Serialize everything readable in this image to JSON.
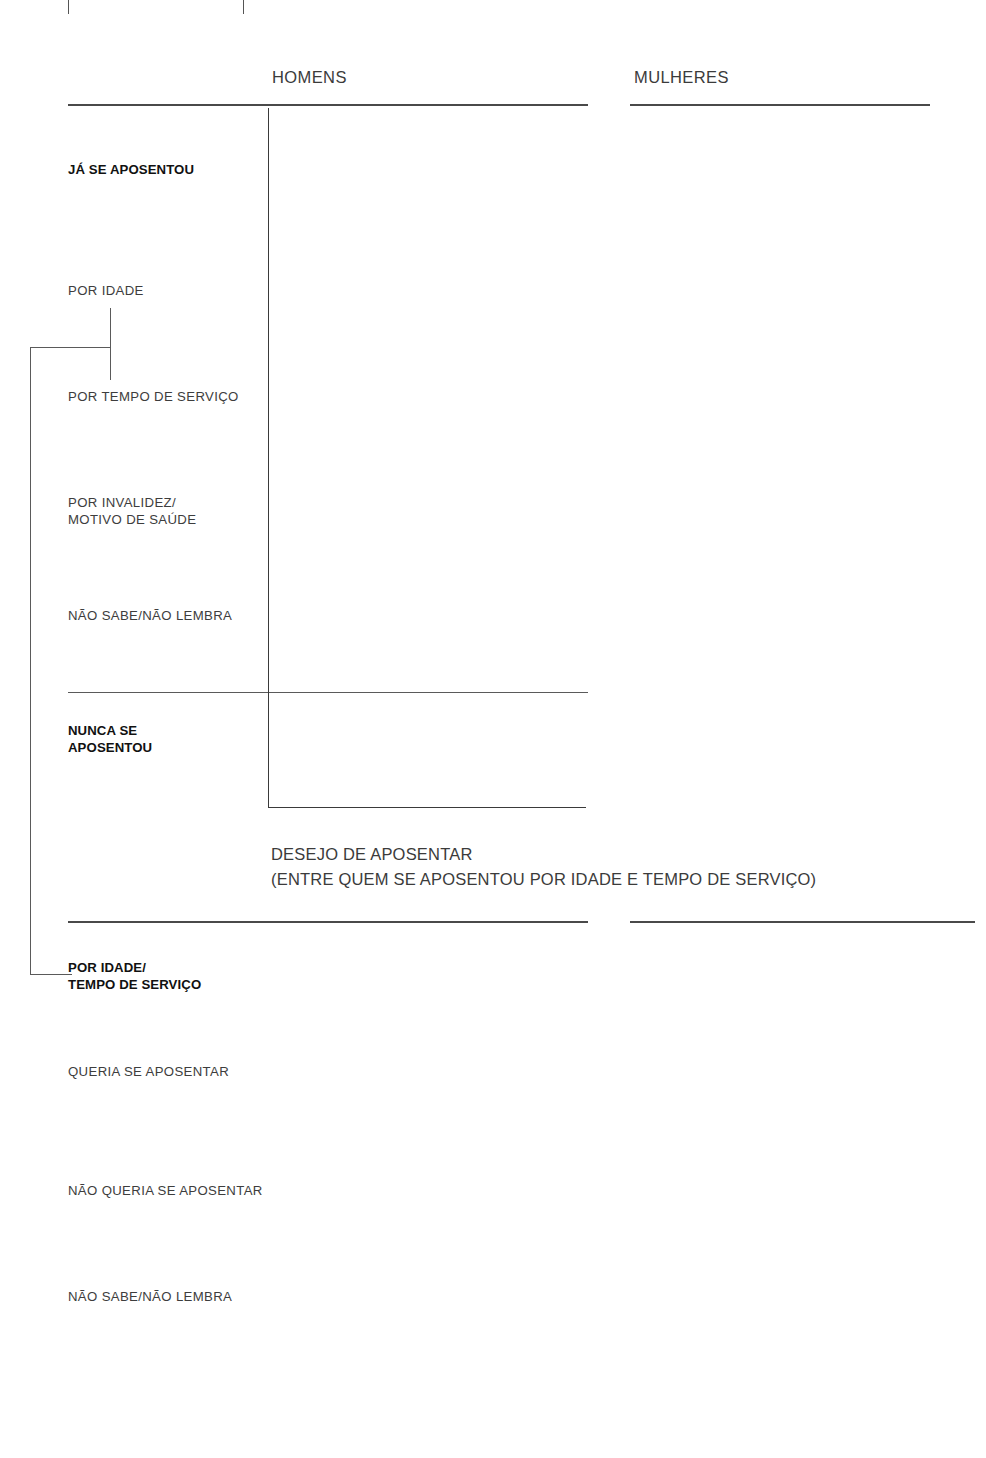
{
  "panels": {
    "left_title": "HOMENS",
    "right_title": "MULHERES"
  },
  "section_subtitle_line1": "DESEJO DE APOSENTAR",
  "section_subtitle_line2": "(ENTRE QUEM SE APOSENTOU POR IDADE E TEMPO DE SERVIÇO)",
  "legend": {
    "items": [
      {
        "label": "80+ ANOS",
        "color": "#8bac3e"
      },
      {
        "label": "70-79 ANOS",
        "color": "#3d82aa"
      },
      {
        "label": "60-69 ANOS",
        "color": "#a9c8c2"
      },
      {
        "label": "TOTAL",
        "color": "#dcd92b"
      }
    ]
  },
  "axis": {
    "ticks": [
      "0",
      "20",
      "40",
      "60",
      "80",
      "100"
    ],
    "min": 0,
    "max": 100
  },
  "chart_data": {
    "type": "bar",
    "orientation": "horizontal",
    "xlabel": "",
    "ylabel": "",
    "xlim": [
      0,
      100
    ],
    "grid": false,
    "legend_position": "right-vertical",
    "series_names": [
      "TOTAL",
      "60-69 ANOS",
      "70-79 ANOS",
      "80+ ANOS"
    ],
    "series_colors": [
      "#dcd92b",
      "#a9c8c2",
      "#3d82aa",
      "#8bac3e"
    ],
    "panels": [
      {
        "name": "HOMENS",
        "section": "APOSENTADORIA",
        "categories": [
          "JÁ SE APOSENTOU",
          "POR IDADE",
          "POR TEMPO DE SERVIÇO",
          "POR INVALIDEZ/\nMOTIVO DE SAÚDE",
          "NÃO SABE/NÃO LEMBRA",
          "NUNCA SE\nAPOSENTOU"
        ],
        "values": {
          "TOTAL": [
            75,
            29,
            36,
            9,
            1,
            25
          ],
          "60-69 ANOS": [
            62,
            20,
            31,
            10,
            1,
            38
          ],
          "70-79 ANOS": [
            92,
            39,
            42,
            7,
            3,
            8
          ],
          "80+ ANOS": [
            93,
            47,
            41,
            5,
            1,
            7
          ]
        }
      },
      {
        "name": "MULHERES",
        "section": "APOSENTADORIA",
        "categories": [
          "JÁ SE APOSENTOU",
          "POR IDADE",
          "POR TEMPO DE SERVIÇO",
          "POR INVALIDEZ/\nMOTIVO DE SAÚDE",
          "NÃO SABE/NÃO LEMBRA",
          "NUNCA SE\nAPOSENTOU"
        ],
        "values": {
          "TOTAL": [
            56,
            31,
            18,
            6,
            1,
            44
          ],
          "60-69 ANOS": [
            46,
            23,
            17,
            5,
            1,
            54
          ],
          "70-79 ANOS": [
            68,
            41,
            19,
            8,
            1,
            32
          ],
          "80+ ANOS": [
            64,
            37,
            20,
            6,
            2,
            36
          ]
        }
      },
      {
        "name": "HOMENS",
        "section": "DESEJO DE APOSENTAR",
        "categories": [
          "POR IDADE/\nTEMPO DE SERVIÇO",
          "QUERIA SE APOSENTAR",
          "NÃO QUERIA SE APOSENTAR",
          "NÃO SABE/NÃO LEMBRA"
        ],
        "values": {
          "TOTAL": [
            68,
            59,
            6,
            2
          ],
          "60-69 ANOS": [
            52,
            47,
            3,
            3
          ],
          "70-79 ANOS": [
            86,
            76,
            9,
            2
          ],
          "80+ ANOS": [
            90,
            71,
            19,
            0
          ]
        }
      },
      {
        "name": "MULHERES",
        "section": "DESEJO DE APOSENTAR",
        "categories": [
          "POR IDADE/\nTEMPO DE SERVIÇO",
          "QUERIA SE APOSENTAR",
          "NÃO QUERIA SE APOSENTAR",
          "NÃO SABE/NÃO LEMBRA"
        ],
        "values": {
          "TOTAL": [
            50,
            45,
            3,
            2
          ],
          "60-69 ANOS": [
            41,
            37,
            3,
            1
          ],
          "70-79 ANOS": [
            62,
            55,
            4,
            2
          ],
          "80+ ANOS": [
            57,
            49,
            4,
            4
          ]
        }
      }
    ],
    "highlighted_values": [
      {
        "panel": 0,
        "category": 0,
        "series": [
          "70-79 ANOS",
          "80+ ANOS"
        ],
        "values": [
          92,
          93
        ]
      },
      {
        "panel": 0,
        "category": 1,
        "series": [
          "70-79 ANOS",
          "80+ ANOS"
        ],
        "values": [
          39,
          47
        ]
      },
      {
        "panel": 0,
        "category": 2,
        "series": [
          "70-79 ANOS",
          "80+ ANOS"
        ],
        "values": [
          42,
          41
        ]
      },
      {
        "panel": 0,
        "category": 5,
        "series": [
          "60-69 ANOS"
        ],
        "values": [
          38
        ]
      },
      {
        "panel": 1,
        "category": 0,
        "series": [
          "70-79 ANOS",
          "80+ ANOS"
        ],
        "values": [
          68,
          64
        ]
      },
      {
        "panel": 1,
        "category": 1,
        "series": [
          "70-79 ANOS",
          "80+ ANOS"
        ],
        "values": [
          41,
          37
        ]
      },
      {
        "panel": 1,
        "category": 5,
        "series": [
          "60-69 ANOS"
        ],
        "values": [
          54
        ]
      },
      {
        "panel": 2,
        "category": 0,
        "series": [
          "70-79 ANOS",
          "80+ ANOS"
        ],
        "values": [
          86,
          90
        ]
      },
      {
        "panel": 2,
        "category": 1,
        "series": [
          "70-79 ANOS",
          "80+ ANOS"
        ],
        "values": [
          76,
          71
        ]
      },
      {
        "panel": 2,
        "category": 2,
        "series": [
          "80+ ANOS"
        ],
        "values": [
          19
        ]
      },
      {
        "panel": 3,
        "category": 0,
        "series": [
          "70-79 ANOS",
          "80+ ANOS"
        ],
        "values": [
          62,
          57
        ]
      },
      {
        "panel": 3,
        "category": 1,
        "series": [
          "70-79 ANOS"
        ],
        "values": [
          55
        ]
      }
    ]
  }
}
